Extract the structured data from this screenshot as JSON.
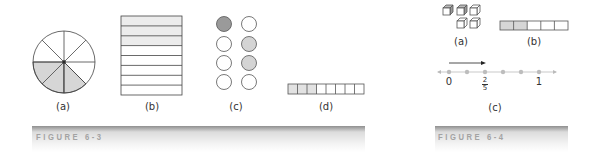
{
  "colors": {
    "stroke": "#444444",
    "shade_light": "#d6d6d6",
    "shade_dark": "#9a9a9a",
    "dot": "#bdbdbd",
    "caption_text": "#a3a3a3"
  },
  "figure_6_3": {
    "caption": "FIGURE 6-3",
    "panels": [
      {
        "label": "(a)",
        "type": "pie",
        "parts": 8,
        "shaded": 3
      },
      {
        "label": "(b)",
        "type": "rectangle-rows",
        "parts": 8,
        "shaded": 3
      },
      {
        "label": "(c)",
        "type": "circle-set",
        "parts": 8,
        "shaded": 3
      },
      {
        "label": "(d)",
        "type": "strip",
        "parts": 8,
        "shaded": 3
      }
    ]
  },
  "figure_6_4": {
    "caption": "FIGURE 6-4",
    "panels": [
      {
        "label": "(a)",
        "type": "cubes",
        "parts": 5,
        "shaded": 2
      },
      {
        "label": "(b)",
        "type": "strip",
        "parts": 5,
        "shaded": 2
      },
      {
        "label": "(c)",
        "type": "number-line",
        "ticks": 6,
        "marks": {
          "start": "0",
          "fraction_numerator": "2",
          "fraction_denominator": "5",
          "end": "1"
        }
      }
    ]
  }
}
